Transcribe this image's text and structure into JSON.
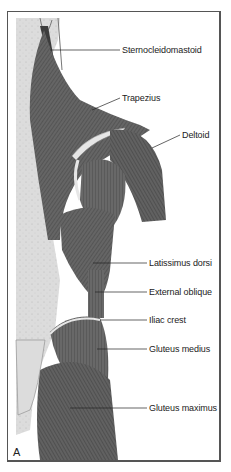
{
  "figure": {
    "panel_letter": "A",
    "view": "posterior torso and hip musculature",
    "colors": {
      "muscle": "#5a5a5a",
      "muscle_dark": "#3c3c3c",
      "muscle_fiber": "#8a8a8a",
      "skin_area": "#d8d8d8",
      "bone_highlight": "#e6e6e6",
      "frame": "#555555",
      "background": "#ffffff"
    },
    "labels": [
      {
        "id": "sternocleidomastoid",
        "text": "Sternocleidomastoid"
      },
      {
        "id": "trapezius",
        "text": "Trapezius"
      },
      {
        "id": "deltoid",
        "text": "Deltoid"
      },
      {
        "id": "latissimus-dorsi",
        "text": "Latissimus dorsi"
      },
      {
        "id": "external-oblique",
        "text": "External oblique"
      },
      {
        "id": "iliac-crest",
        "text": "Iliac crest"
      },
      {
        "id": "gluteus-medius",
        "text": "Gluteus medius"
      },
      {
        "id": "gluteus-maximus",
        "text": "Gluteus maximus"
      }
    ]
  }
}
